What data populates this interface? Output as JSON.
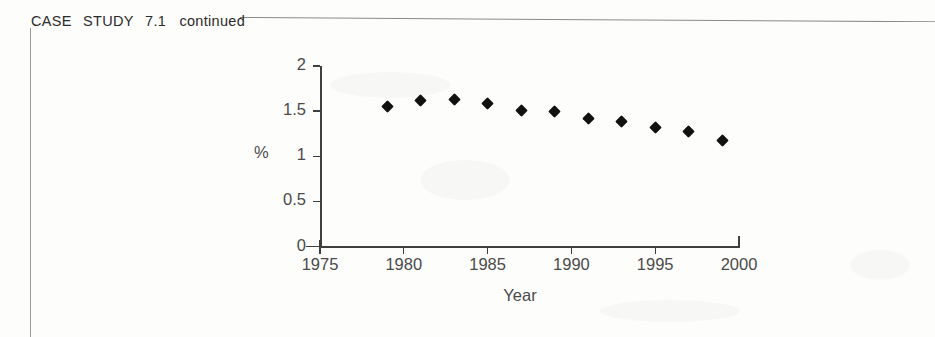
{
  "page": {
    "case_label_words": [
      "CASE",
      "STUDY",
      "7.1"
    ],
    "case_label_continued": "continued"
  },
  "chart_data": {
    "type": "scatter",
    "title": "",
    "xlabel": "Year",
    "ylabel": "%",
    "xlim": [
      1975,
      2000
    ],
    "ylim": [
      0,
      2
    ],
    "grid": false,
    "legend": false,
    "x_ticks": [
      1975,
      1980,
      1985,
      1990,
      1995,
      2000
    ],
    "x_tick_labels": [
      "1975",
      "1980",
      "1985",
      "1990",
      "1995",
      "2000"
    ],
    "y_ticks": [
      0,
      0.5,
      1,
      1.5,
      2
    ],
    "y_tick_labels": [
      "0",
      "0.5",
      "1",
      "1.5",
      "2"
    ],
    "marker": "diamond",
    "marker_color": "#111111",
    "x": [
      1979,
      1981,
      1983,
      1985,
      1987,
      1989,
      1991,
      1993,
      1995,
      1997,
      1999
    ],
    "y": [
      1.55,
      1.62,
      1.63,
      1.59,
      1.51,
      1.5,
      1.42,
      1.39,
      1.32,
      1.27,
      1.18
    ]
  }
}
